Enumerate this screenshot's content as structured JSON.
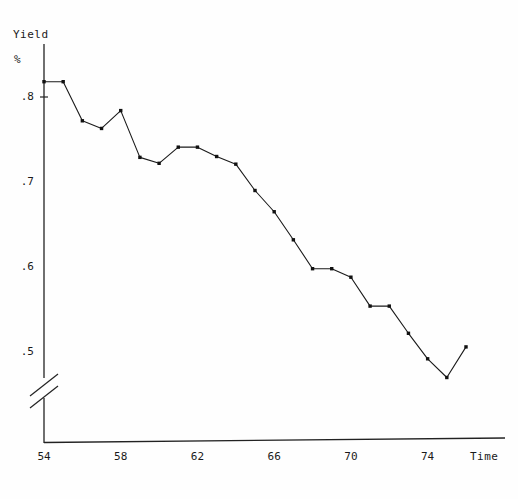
{
  "chart_data": {
    "type": "line",
    "title": "",
    "subtitle": "",
    "xlabel": "Time",
    "ylabel": "Yield",
    "ylabel_unit": "%",
    "x": [
      54,
      55,
      56,
      57,
      58,
      59,
      60,
      61,
      62,
      63,
      64,
      65,
      66,
      67,
      68,
      69,
      70,
      71,
      72,
      73,
      74,
      75,
      76
    ],
    "values": [
      0.818,
      0.818,
      0.772,
      0.763,
      0.784,
      0.729,
      0.722,
      0.741,
      0.741,
      0.73,
      0.721,
      0.69,
      0.665,
      0.632,
      0.598,
      0.598,
      0.588,
      0.554,
      0.554,
      0.522,
      0.492,
      0.47,
      0.506
    ],
    "series": [
      {
        "name": "Yield %",
        "values": [
          0.818,
          0.818,
          0.772,
          0.763,
          0.784,
          0.729,
          0.722,
          0.741,
          0.741,
          0.73,
          0.721,
          0.69,
          0.665,
          0.632,
          0.598,
          0.598,
          0.588,
          0.554,
          0.554,
          0.522,
          0.492,
          0.47,
          0.506
        ]
      }
    ],
    "xticks": [
      54,
      58,
      62,
      66,
      70,
      74
    ],
    "xtick_labels": [
      "54",
      "58",
      "62",
      "66",
      "70",
      "74"
    ],
    "yticks": [
      0.5,
      0.6,
      0.7,
      0.8
    ],
    "ytick_labels": [
      ".5",
      ".6",
      ".7",
      ".8"
    ],
    "xlim": [
      54,
      76
    ],
    "ylim": [
      0.46,
      0.84
    ],
    "grid": false,
    "legend": false,
    "legend_position": "none",
    "axis_break": true,
    "axis_break_note": "double-slash break on y-axis below .5",
    "marker": "filled-square",
    "line_color": "#1a1a1a",
    "marker_color": "#111111",
    "axis_color": "#222222",
    "background_color": "#fefefe"
  },
  "labels": {
    "y_axis_name": "Yield",
    "y_axis_unit": "%",
    "x_axis_name": "Time"
  }
}
